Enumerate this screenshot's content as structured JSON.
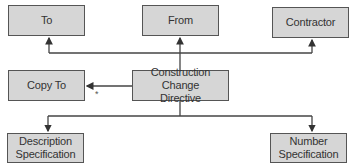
{
  "diagram": {
    "type": "flowchart",
    "center": {
      "label": "Construction Change\nDirective",
      "line1": "Construction Change",
      "line2": "Directive"
    },
    "top_nodes": [
      {
        "id": "to",
        "label": "To"
      },
      {
        "id": "from",
        "label": "From"
      },
      {
        "id": "contractor",
        "label": "Contractor"
      }
    ],
    "side_node": {
      "id": "copy-to",
      "label": "Copy To"
    },
    "bottom_nodes": [
      {
        "id": "description-spec",
        "line1": "Description",
        "line2": "Specification"
      },
      {
        "id": "number-spec",
        "line1": "Number",
        "line2": "Specification"
      }
    ],
    "edges": [
      {
        "from": "center",
        "to": "to"
      },
      {
        "from": "center",
        "to": "from"
      },
      {
        "from": "center",
        "to": "contractor"
      },
      {
        "from": "center",
        "to": "copy-to"
      },
      {
        "from": "center",
        "to": "description-spec"
      },
      {
        "from": "center",
        "to": "number-spec"
      }
    ],
    "annotation_mark": "*",
    "colors": {
      "box_fill": "#d6d6d6",
      "box_border": "#555555",
      "line": "#444444",
      "text": "#333333"
    }
  }
}
